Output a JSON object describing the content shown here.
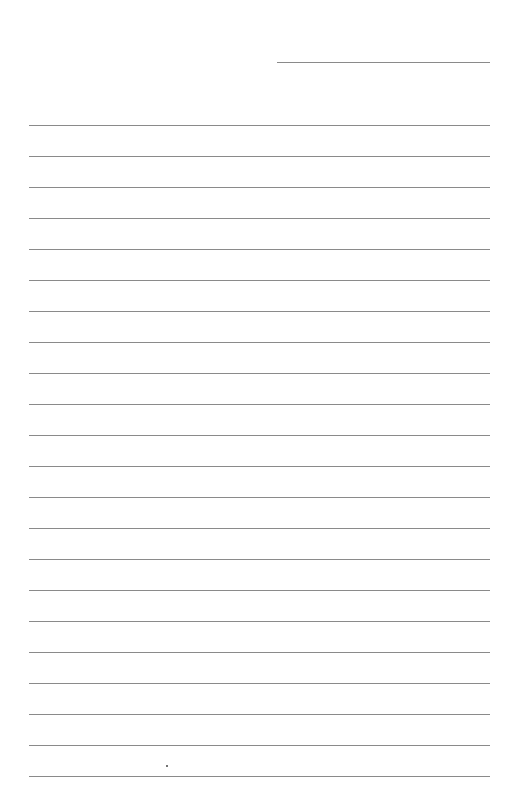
{
  "page": {
    "type": "lined-paper",
    "background": "#ffffff",
    "line_color": "#8a8a8a",
    "header_line": {
      "label": ""
    },
    "ruled_line_count": 22,
    "first_line_y": 125,
    "line_spacing": 31,
    "text": ""
  }
}
